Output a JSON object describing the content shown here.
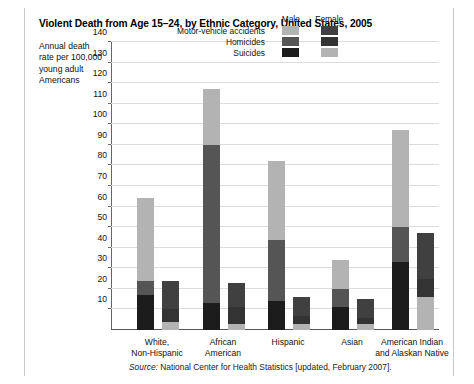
{
  "title": "Violent Death from Age 15–24, by Ethnic Category, United States, 2005",
  "axis_caption": "Annual death rate per 100,000 young adult Americans",
  "source_prefix": "Source:",
  "source_text": "National Center for Health Statistics [updated, February 2007].",
  "legend": {
    "col_male": "Male",
    "col_female": "Female",
    "rows": [
      {
        "label": "Motor-vehicle accidents",
        "male_color": "#b3b3b3",
        "female_color": "#404040"
      },
      {
        "label": "Homicides",
        "male_color": "#555555",
        "female_color": "#333333"
      },
      {
        "label": "Suicides",
        "male_color": "#1c1c1c",
        "female_color": "#b3b3b3"
      }
    ]
  },
  "chart_data": {
    "type": "bar",
    "subtype": "grouped-stacked",
    "title": "Violent Death from Age 15–24, by Ethnic Category, United States, 2005",
    "xlabel": "",
    "ylabel": "Annual death rate per 100,000 young adult Americans",
    "ylim": [
      0,
      140
    ],
    "ytick_step": 10,
    "yticks": [
      10,
      20,
      30,
      40,
      50,
      60,
      70,
      80,
      90,
      100,
      110,
      120,
      130,
      140
    ],
    "grid": true,
    "legend_position": "top-center",
    "categories": [
      "White, Non-Hispanic",
      "African American",
      "Hispanic",
      "Asian",
      "American Indian and Alaskan Native"
    ],
    "stack_order_bottom_to_top": [
      "Suicides",
      "Homicides",
      "Motor-vehicle accidents"
    ],
    "series": [
      {
        "name": "Male",
        "stacks": [
          {
            "category": "White, Non-Hispanic",
            "Suicides": 17,
            "Homicides": 7,
            "Motor-vehicle accidents": 40,
            "total": 64
          },
          {
            "category": "African American",
            "Suicides": 13,
            "Homicides": 77,
            "Motor-vehicle accidents": 27,
            "total": 117
          },
          {
            "category": "Hispanic",
            "Suicides": 14,
            "Homicides": 30,
            "Motor-vehicle accidents": 38,
            "total": 82
          },
          {
            "category": "Asian",
            "Suicides": 11,
            "Homicides": 9,
            "Motor-vehicle accidents": 14,
            "total": 34
          },
          {
            "category": "American Indian and Alaskan Native",
            "Suicides": 33,
            "Homicides": 17,
            "Motor-vehicle accidents": 47,
            "total": 97
          }
        ]
      },
      {
        "name": "Female",
        "stacks": [
          {
            "category": "White, Non-Hispanic",
            "Suicides": 4,
            "Homicides": 6,
            "Motor-vehicle accidents": 14,
            "total": 24
          },
          {
            "category": "African American",
            "Suicides": 3,
            "Homicides": 8,
            "Motor-vehicle accidents": 12,
            "total": 23
          },
          {
            "category": "Hispanic",
            "Suicides": 3,
            "Homicides": 4,
            "Motor-vehicle accidents": 9,
            "total": 16
          },
          {
            "category": "Asian",
            "Suicides": 3,
            "Homicides": 3,
            "Motor-vehicle accidents": 9,
            "total": 15
          },
          {
            "category": "American Indian and Alaskan Native",
            "Suicides": 16,
            "Homicides": 9,
            "Motor-vehicle accidents": 22,
            "total": 47
          }
        ]
      }
    ],
    "colors": {
      "male_motor": "#b3b3b3",
      "male_homicide": "#555555",
      "male_suicide": "#1c1c1c",
      "female_motor": "#404040",
      "female_homicide": "#333333",
      "female_suicide": "#b3b3b3"
    }
  }
}
